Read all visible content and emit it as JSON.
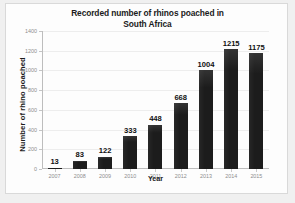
{
  "chart_data": {
    "type": "bar",
    "title": "Recorded number of rhinos poached in South Africa",
    "title_line1": "Recorded number of rhinos poached in",
    "title_line2": "South Africa",
    "xlabel": "Year",
    "ylabel": "Number of rhino  poached",
    "categories": [
      "2007",
      "2008",
      "2009",
      "2010",
      "2011",
      "2012",
      "2013",
      "2014",
      "2015"
    ],
    "values": [
      13,
      83,
      122,
      333,
      448,
      668,
      1004,
      1215,
      1175
    ],
    "data_labels": [
      "13",
      "83",
      "122",
      "333",
      "448",
      "668",
      "1004",
      "1215",
      "1175"
    ],
    "ylim": [
      0,
      1400
    ],
    "yticks": [
      0,
      200,
      400,
      600,
      800,
      1000,
      1200,
      1400
    ],
    "ytick_labels": [
      "0",
      "200",
      "400",
      "600",
      "800",
      "1000",
      "1200",
      "1400"
    ],
    "grid": true,
    "legend": false,
    "bar_color": "#1c1c1c",
    "plot_background": "#fdfdfd"
  }
}
